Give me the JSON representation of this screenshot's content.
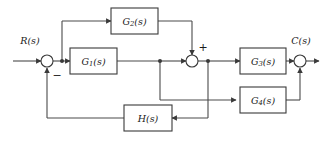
{
  "diagram": {
    "type": "control-system-block-diagram",
    "canvas": {
      "width": 324,
      "height": 145,
      "background": "#ffffff"
    },
    "stroke_color": "#4a4a4a",
    "text_color": "#1a1a1a",
    "input": {
      "name": "input-signal",
      "label": "R(s)"
    },
    "output": {
      "name": "output-signal",
      "label": "C(s)"
    },
    "blocks": [
      {
        "id": "G1",
        "name": "block-g1",
        "base": "G",
        "subscript": "1",
        "arg": "(s)",
        "label": "G₁(s)"
      },
      {
        "id": "G2",
        "name": "block-g2",
        "base": "G",
        "subscript": "2",
        "arg": "(s)",
        "label": "G₂(s)"
      },
      {
        "id": "G3",
        "name": "block-g3",
        "base": "G",
        "subscript": "3",
        "arg": "(s)",
        "label": "G₃(s)"
      },
      {
        "id": "G4",
        "name": "block-g4",
        "base": "G",
        "subscript": "4",
        "arg": "(s)",
        "label": "G₄(s)"
      },
      {
        "id": "H",
        "name": "block-h",
        "base": "H",
        "subscript": "",
        "arg": "(s)",
        "label": "H(s)"
      }
    ],
    "summing_junctions": [
      {
        "id": "S1",
        "name": "summing-junction-input",
        "signs": [
          "-"
        ],
        "sign_label": "−"
      },
      {
        "id": "S2",
        "name": "summing-junction-middle",
        "signs": [
          "+"
        ],
        "sign_label": "+"
      },
      {
        "id": "S3",
        "name": "summing-junction-output",
        "signs": [],
        "sign_label": ""
      }
    ],
    "signs": {
      "minus": "−",
      "plus": "+"
    }
  }
}
